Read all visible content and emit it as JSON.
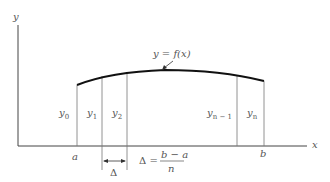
{
  "axes": {
    "x_label": "x",
    "y_label": "y"
  },
  "curve": {
    "label": "y = f(x)"
  },
  "endpoints": {
    "a": "a",
    "b": "b"
  },
  "ordinates": [
    {
      "base": "y",
      "sub": "0"
    },
    {
      "base": "y",
      "sub": "1"
    },
    {
      "base": "y",
      "sub": "2"
    },
    {
      "base": "y",
      "sub": "n − 1"
    },
    {
      "base": "y",
      "sub": "n"
    }
  ],
  "interval": {
    "symbol": "Δ",
    "formula_lhs": "Δ =",
    "numerator": "b − a",
    "denominator": "n"
  }
}
